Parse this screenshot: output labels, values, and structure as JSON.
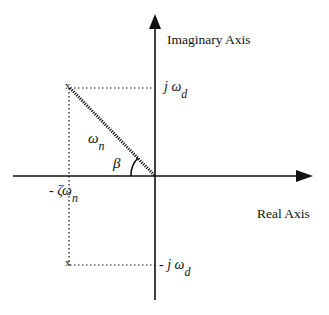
{
  "axes": {
    "imaginary_label": "Imaginary  Axis",
    "real_label": "Real Axis"
  },
  "labels": {
    "j_omega_d": {
      "prefix": "j ω",
      "sub": "d"
    },
    "neg_j_omega_d": {
      "prefix": "- j ω",
      "sub": "d"
    },
    "omega_n": {
      "main": "ω",
      "sub": "n"
    },
    "beta": "β",
    "neg_zeta_omega_n": {
      "main": "- ζω",
      "sub": "n"
    }
  },
  "poles": {
    "upper": "x",
    "lower": "x"
  },
  "colors": {
    "line": "#111111",
    "background": "#ffffff"
  }
}
